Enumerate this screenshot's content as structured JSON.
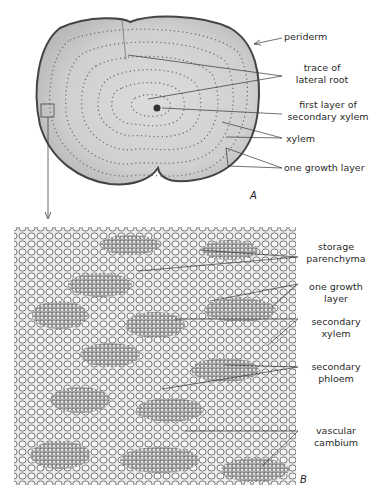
{
  "figure": {
    "panel_a": {
      "letter": "A",
      "labels": {
        "periderm": "periderm",
        "trace_lateral_root_1": "trace of",
        "trace_lateral_root_2": "lateral root",
        "first_layer_1": "first layer of",
        "first_layer_2": "secondary xylem",
        "xylem": "xylem",
        "growth_layer": "one growth layer"
      }
    },
    "panel_b": {
      "letter": "B",
      "labels": {
        "storage_1": "storage",
        "storage_2": "parenchyma",
        "growth_1": "one growth",
        "growth_2": "layer",
        "sec_xylem_1": "secondary",
        "sec_xylem_2": "xylem",
        "sec_phloem_1": "secondary",
        "sec_phloem_2": "phloem",
        "cambium_1": "vascular",
        "cambium_2": "cambium"
      }
    },
    "colors": {
      "background": "#ffffff",
      "tissue_light": "#e6e6e6",
      "tissue_mid": "#c8c8c8",
      "ring_dots": "#555555",
      "lines": "#333333"
    }
  }
}
